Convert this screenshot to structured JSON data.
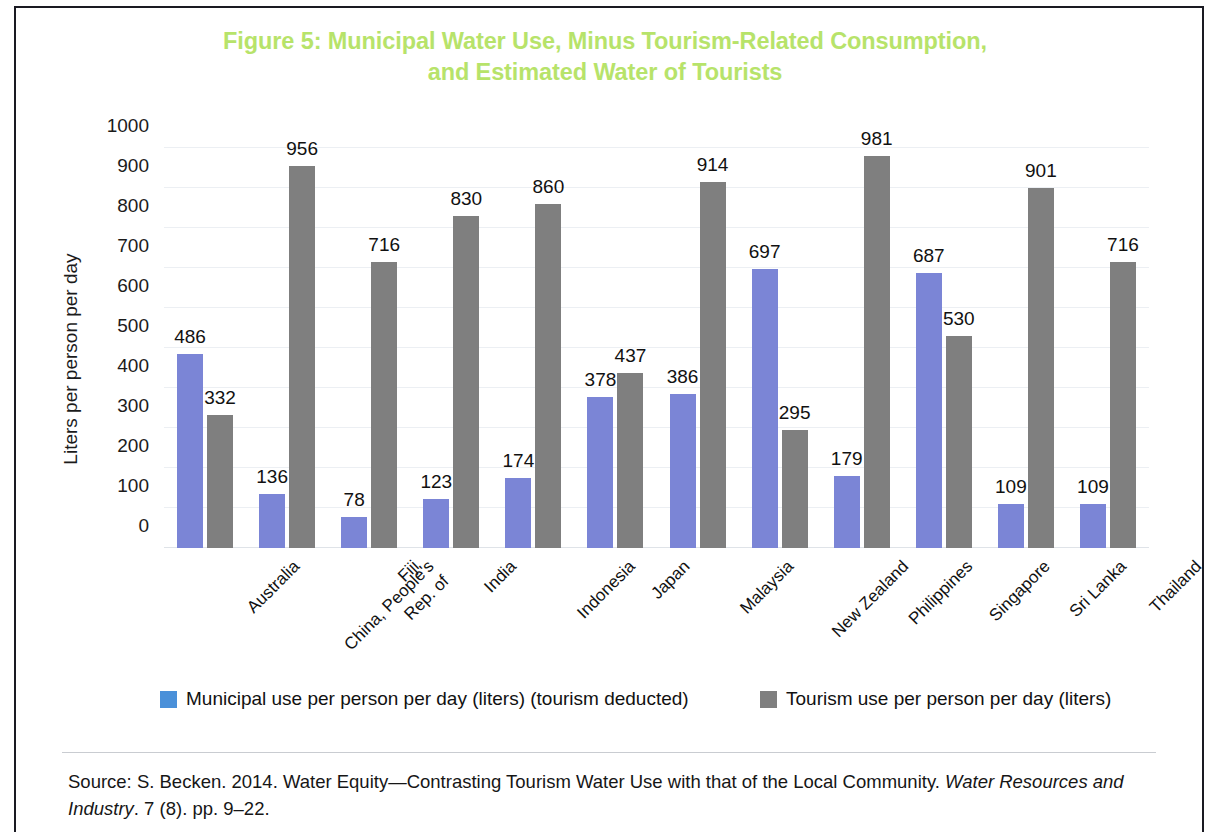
{
  "figure": {
    "title_line1": "Figure 5: Municipal Water Use, Minus Tourism-Related Consumption,",
    "title_line2": "and Estimated Water of Tourists",
    "title_color": "#b7e36a"
  },
  "legend": {
    "position": "bottom",
    "items": [
      {
        "label": "Municipal use per person per day (liters) (tourism deducted)",
        "color": "#4a90d9"
      },
      {
        "label": "Tourism use per person per day (liters)",
        "color": "#7f7f7f"
      }
    ]
  },
  "source": {
    "part1": "Source: S. Becken. 2014. Water Equity—Contrasting Tourism Water Use with that of the Local Community. ",
    "italic": "Water Resources and Industry",
    "part2": ". 7 (8). pp. 9–22."
  },
  "chart_data": {
    "type": "bar",
    "title": "Figure 5: Municipal Water Use, Minus Tourism-Related Consumption, and Estimated Water of Tourists",
    "xlabel": "",
    "ylabel": "Liters per person per day",
    "ylim": [
      0,
      1000
    ],
    "yticks": [
      0,
      100,
      200,
      300,
      400,
      500,
      600,
      700,
      800,
      900,
      1000
    ],
    "grid": true,
    "legend_position": "bottom",
    "categories": [
      "Australia",
      "China, People's Rep. of",
      "Fiji",
      "India",
      "Indonesia",
      "Japan",
      "Malaysia",
      "New Zealand",
      "Philippines",
      "Singapore",
      "Sri Lanka",
      "Thailand"
    ],
    "category_lines": [
      [
        "Australia"
      ],
      [
        "China, People's",
        "Rep. of"
      ],
      [
        "Fiji"
      ],
      [
        "India"
      ],
      [
        "Indonesia"
      ],
      [
        "Japan"
      ],
      [
        "Malaysia"
      ],
      [
        "New Zealand"
      ],
      [
        "Philippines"
      ],
      [
        "Singapore"
      ],
      [
        "Sri Lanka"
      ],
      [
        "Thailand"
      ]
    ],
    "series": [
      {
        "name": "Municipal use per person per day (liters) (tourism deducted)",
        "color": "#7b85d6",
        "values": [
          486,
          136,
          78,
          123,
          174,
          378,
          386,
          697,
          179,
          687,
          109,
          109
        ]
      },
      {
        "name": "Tourism use per person per day (liters)",
        "color": "#7f7f7f",
        "values": [
          332,
          956,
          716,
          830,
          860,
          437,
          914,
          295,
          981,
          530,
          901,
          716
        ]
      }
    ]
  }
}
